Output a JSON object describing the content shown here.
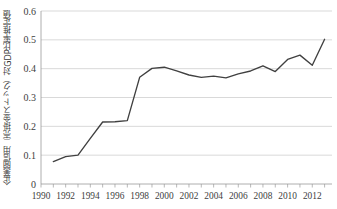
{
  "chart_data": {
    "type": "line",
    "title": "",
    "xlabel": "",
    "ylabel": "企業間信用（売掛金ストック）対GDP比率推定値",
    "xlim": [
      1990,
      2013.6
    ],
    "ylim": [
      0,
      0.6
    ],
    "grid": true,
    "legend": false,
    "y_ticks": [
      "0",
      "0.1",
      "0.2",
      "0.3",
      "0.4",
      "0.5",
      "0.6"
    ],
    "y_tick_values": [
      0,
      0.1,
      0.2,
      0.3,
      0.4,
      0.5,
      0.6
    ],
    "x_ticks": [
      "1990",
      "1992",
      "1994",
      "1996",
      "1998",
      "2000",
      "2002",
      "2004",
      "2006",
      "2008",
      "2010",
      "2012"
    ],
    "x_tick_values": [
      1990,
      1992,
      1994,
      1996,
      1998,
      2000,
      2002,
      2004,
      2006,
      2008,
      2010,
      2012
    ],
    "x_minor_ticks": [
      1990,
      1991,
      1992,
      1993,
      1994,
      1995,
      1996,
      1997,
      1998,
      1999,
      2000,
      2001,
      2002,
      2003,
      2004,
      2005,
      2006,
      2007,
      2008,
      2009,
      2010,
      2011,
      2012,
      2013
    ],
    "series": [
      {
        "name": "企業間信用（売掛金ストック）対GDP比率推定値",
        "color": "#404040",
        "x": [
          1991,
          1992,
          1993,
          1994,
          1995,
          1996,
          1997,
          1998,
          1999,
          2000,
          2001,
          2002,
          2003,
          2004,
          2005,
          2006,
          2007,
          2008,
          2009,
          2010,
          2011,
          2012,
          2013
        ],
        "values": [
          0.078,
          0.095,
          0.1,
          0.158,
          0.215,
          0.216,
          0.22,
          0.37,
          0.401,
          0.405,
          0.392,
          0.378,
          0.37,
          0.374,
          0.368,
          0.382,
          0.392,
          0.41,
          0.39,
          0.432,
          0.447,
          0.412,
          0.502
        ]
      }
    ]
  }
}
